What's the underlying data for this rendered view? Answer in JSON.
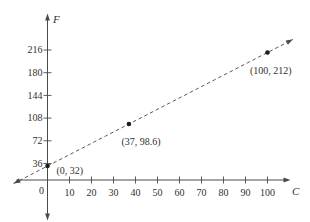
{
  "figure": {
    "background": "#ffffff",
    "ink_color": "#4a4a4a",
    "dash_color": "#5a5a5a",
    "point_color": "#1c1c1c",
    "text_color": "#33302c"
  },
  "chart_data": {
    "type": "line",
    "line_style": "dashed",
    "title": "",
    "xlabel": "C",
    "ylabel": "F",
    "origin_label": "0",
    "x_ticks": [
      10,
      20,
      30,
      40,
      50,
      60,
      70,
      80,
      90,
      100
    ],
    "y_ticks": [
      216,
      180,
      144,
      108,
      72,
      36
    ],
    "xlim": [
      -16,
      112
    ],
    "ylim": [
      -30,
      260
    ],
    "grid": false,
    "points": [
      {
        "x": 0,
        "y": 32,
        "label": "(0, 32)"
      },
      {
        "x": 37,
        "y": 98.6,
        "label": "(37, 98.6)"
      },
      {
        "x": 100,
        "y": 212,
        "label": "(100, 212)"
      }
    ]
  }
}
